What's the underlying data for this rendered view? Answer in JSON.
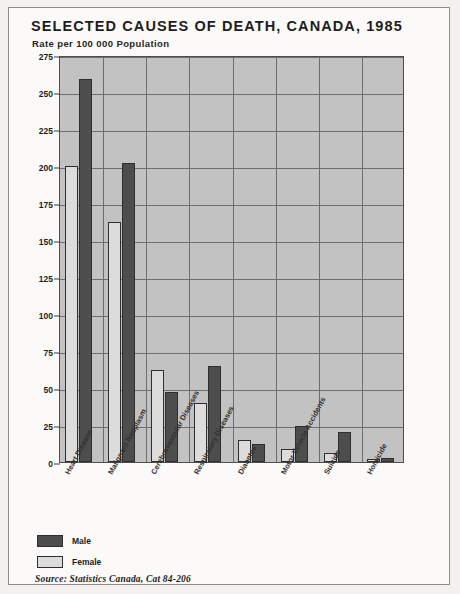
{
  "chart_data": {
    "type": "bar",
    "title": "SELECTED CAUSES OF DEATH, CANADA, 1985",
    "subtitle": "Rate per 100 000 Population",
    "ylabel": "Rate per 100 000 Population",
    "xlabel": "",
    "ylim": [
      0,
      275
    ],
    "yticks": [
      0,
      25,
      50,
      75,
      100,
      125,
      150,
      175,
      200,
      225,
      250,
      275
    ],
    "ytick_labels": [
      "0",
      "25",
      "50",
      "75",
      "100",
      "125",
      "150",
      "175",
      "200",
      "225",
      "250",
      "275"
    ],
    "grid": true,
    "legend_position": "below-left",
    "categories": [
      "Heart Disease",
      "Malignant Neoplasm",
      "Cerebrovascular Diseases",
      "Respiratory Diseases",
      "Diabetes",
      "Motor Vehicle Accidents",
      "Suicide",
      "Homicide"
    ],
    "series": [
      {
        "name": "Female",
        "color": "#dcdcdc",
        "values": [
          200,
          162,
          62,
          40,
          15,
          9,
          6,
          2
        ]
      },
      {
        "name": "Male",
        "color": "#4d4d4d",
        "values": [
          259,
          202,
          47,
          65,
          12,
          24,
          20,
          3
        ]
      }
    ],
    "source": "Source: Statistics Canada, Cat 84-206"
  },
  "legend": {
    "items": [
      {
        "label": "Male"
      },
      {
        "label": "Female"
      }
    ]
  }
}
